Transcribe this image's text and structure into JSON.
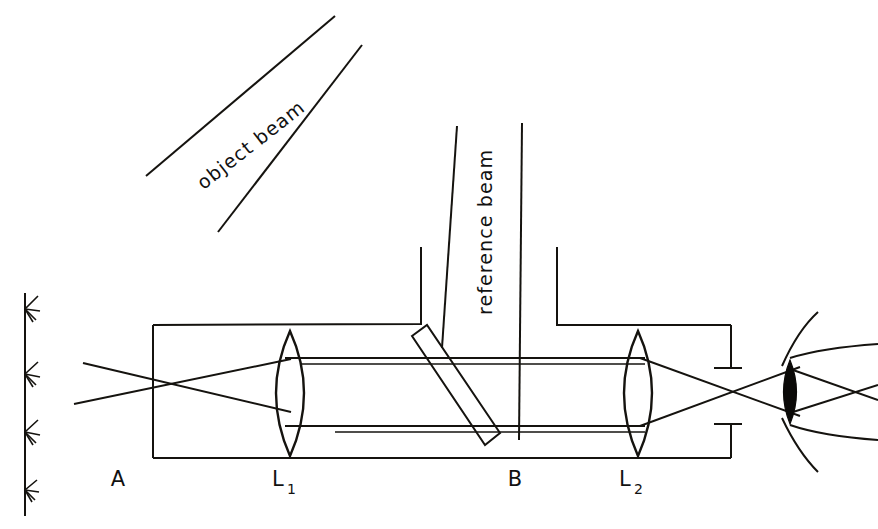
{
  "figure": {
    "background_color": "#ffffff",
    "ink_color": "#15130f",
    "width": 878,
    "height": 529
  },
  "labels": {
    "point_a": "A",
    "point_b": "B",
    "lens1_main": "L",
    "lens1_sub": "1",
    "lens2_main": "L",
    "lens2_sub": "2",
    "object_beam": "object beam",
    "reference_beam": "reference beam"
  },
  "components": [
    {
      "id": "focus-point-a",
      "name": "A",
      "type": "focal-point",
      "x": 152,
      "y": 383
    },
    {
      "id": "lens-l1",
      "name": "L1",
      "type": "biconvex-lens",
      "x": 290,
      "y": 393
    },
    {
      "id": "beamsplitter-b",
      "name": "B",
      "type": "beamsplitter-plate",
      "x": 455,
      "y": 393,
      "angle_deg": 45
    },
    {
      "id": "lens-l2",
      "name": "L2",
      "type": "biconvex-lens",
      "x": 638,
      "y": 393
    },
    {
      "id": "eye",
      "name": "eye",
      "type": "observer-eye",
      "x": 800,
      "y": 390
    },
    {
      "id": "housing",
      "name": "enclosure",
      "type": "housing-outline"
    },
    {
      "id": "wavefront-axis",
      "name": "wavefront arrows",
      "type": "vertical-axis-with-arrows",
      "x": 24,
      "arrow_count": 4
    }
  ],
  "beams": {
    "object_beam_label_rotation_deg": -38,
    "reference_beam_label_rotation_deg": -90,
    "object_beam_lines": 2,
    "reference_beam_lines": 2,
    "horizontal_beam_lines": 2
  },
  "wavefront_arrows": [
    {
      "y": 310
    },
    {
      "y": 374
    },
    {
      "y": 432
    },
    {
      "y": 490
    }
  ]
}
